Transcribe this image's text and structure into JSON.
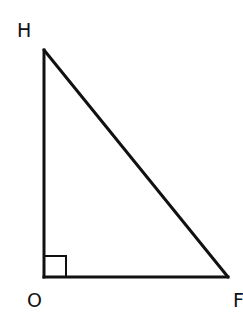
{
  "diagram": {
    "type": "right-triangle",
    "stroke_color": "#111111",
    "vertices": [
      {
        "label": "H",
        "x": 44,
        "y": 50
      },
      {
        "label": "O",
        "x": 44,
        "y": 277
      },
      {
        "label": "F",
        "x": 228,
        "y": 277
      }
    ],
    "right_angle_at": "O",
    "labels": {
      "H": "H",
      "O": "O",
      "F": "F"
    }
  }
}
